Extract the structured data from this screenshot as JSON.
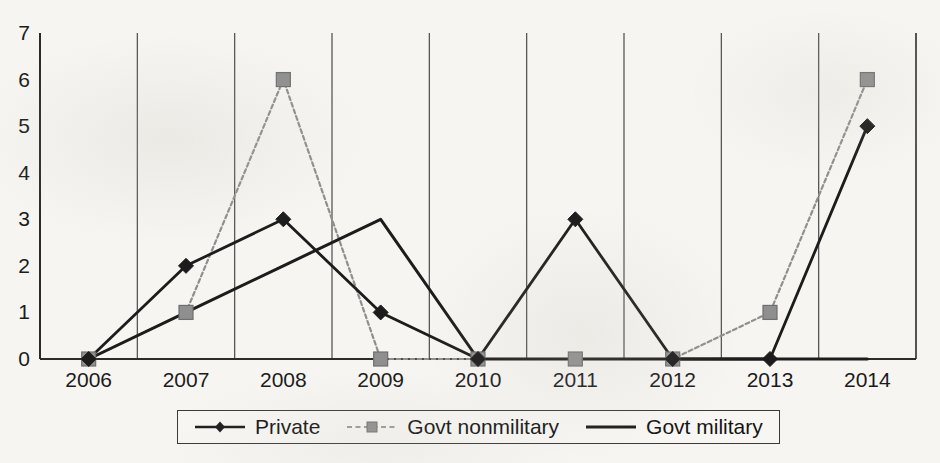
{
  "chart_data": {
    "type": "line",
    "title": "",
    "subtitle": "",
    "xlabel": "",
    "ylabel": "",
    "categories": [
      "2006",
      "2007",
      "2008",
      "2009",
      "2010",
      "2011",
      "2012",
      "2013",
      "2014"
    ],
    "ylim": [
      0,
      7
    ],
    "yticks": [
      0,
      1,
      2,
      3,
      4,
      5,
      6,
      7
    ],
    "grid": "vertical-only",
    "legend_position": "bottom-center",
    "series": [
      {
        "name": "Private",
        "values": [
          0,
          2,
          3,
          1,
          0,
          3,
          0,
          0,
          5
        ],
        "color": "#1c1c1c",
        "marker": "diamond",
        "line_style": "solid"
      },
      {
        "name": "Govt nonmilitary",
        "values": [
          0,
          1,
          6,
          0,
          0,
          0,
          0,
          1,
          6
        ],
        "color": "#8f8f8f",
        "marker": "square",
        "line_style": "dashed"
      },
      {
        "name": "Govt military",
        "values": [
          0,
          1,
          2,
          3,
          0,
          0,
          0,
          0,
          0
        ],
        "color": "#1c1c1c",
        "marker": "none",
        "line_style": "solid"
      }
    ]
  },
  "legend": {
    "items": [
      {
        "label": "Private"
      },
      {
        "label": "Govt nonmilitary"
      },
      {
        "label": "Govt military"
      }
    ]
  },
  "axes": {
    "y_tick_labels": [
      "7",
      "6",
      "5",
      "4",
      "3",
      "2",
      "1",
      "0"
    ],
    "x_tick_labels": [
      "2006",
      "2007",
      "2008",
      "2009",
      "2010",
      "2011",
      "2012",
      "2013",
      "2014"
    ]
  },
  "colors": {
    "background": "#f6f5f1",
    "axis": "#2b2b2b",
    "gridline": "#4a4a4a",
    "series_dark": "#1c1c1c",
    "series_gray": "#8f8f8f"
  }
}
